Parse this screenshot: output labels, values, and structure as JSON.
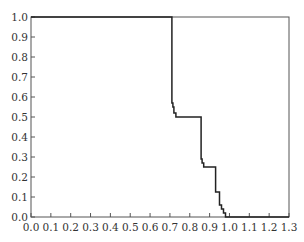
{
  "chart_data": {
    "type": "line",
    "title": "",
    "xlabel": "",
    "ylabel": "",
    "xlim": [
      0.0,
      1.3
    ],
    "ylim": [
      0.0,
      1.0
    ],
    "grid": false,
    "legend": null,
    "x_ticks": [
      "0.0",
      "0.1",
      "0.2",
      "0.3",
      "0.4",
      "0.5",
      "0.6",
      "0.7",
      "0.8",
      "0.9",
      "1.0",
      "1.1",
      "1.2",
      "1.3"
    ],
    "y_ticks": [
      "0.0",
      "0.1",
      "0.2",
      "0.3",
      "0.4",
      "0.5",
      "0.6",
      "0.7",
      "0.8",
      "0.9",
      "1.0"
    ],
    "series": [
      {
        "name": "step curve",
        "style": "step",
        "color": "#222222",
        "points": [
          [
            0.0,
            1.0
          ],
          [
            0.71,
            1.0
          ],
          [
            0.71,
            0.57
          ],
          [
            0.715,
            0.57
          ],
          [
            0.715,
            0.55
          ],
          [
            0.72,
            0.55
          ],
          [
            0.72,
            0.52
          ],
          [
            0.73,
            0.52
          ],
          [
            0.73,
            0.5
          ],
          [
            0.857,
            0.5
          ],
          [
            0.857,
            0.29
          ],
          [
            0.862,
            0.29
          ],
          [
            0.862,
            0.27
          ],
          [
            0.87,
            0.27
          ],
          [
            0.87,
            0.25
          ],
          [
            0.93,
            0.25
          ],
          [
            0.93,
            0.125
          ],
          [
            0.95,
            0.125
          ],
          [
            0.95,
            0.06
          ],
          [
            0.96,
            0.06
          ],
          [
            0.96,
            0.04
          ],
          [
            0.97,
            0.04
          ],
          [
            0.97,
            0.02
          ],
          [
            0.98,
            0.02
          ],
          [
            0.98,
            0.0
          ],
          [
            1.0,
            0.0
          ],
          [
            1.3,
            0.0
          ]
        ]
      }
    ]
  }
}
